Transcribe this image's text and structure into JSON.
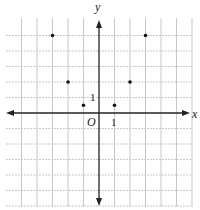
{
  "chart_data": {
    "type": "scatter",
    "title": "",
    "xlabel": "x",
    "ylabel": "y",
    "origin_label": "O",
    "tick_labels": {
      "x_unit": "1",
      "y_unit": "1"
    },
    "grid": true,
    "xlim": [
      -5,
      6
    ],
    "ylim": [
      -6,
      5
    ],
    "points": [
      {
        "x": -3,
        "y": 5
      },
      {
        "x": -2,
        "y": 2
      },
      {
        "x": -1,
        "y": 0.5
      },
      {
        "x": 1,
        "y": 0.5
      },
      {
        "x": 2,
        "y": 2
      },
      {
        "x": 3,
        "y": 5
      }
    ],
    "colors": {
      "grid": "#c8c8c8",
      "axis": "#222222",
      "point": "#111111"
    }
  }
}
